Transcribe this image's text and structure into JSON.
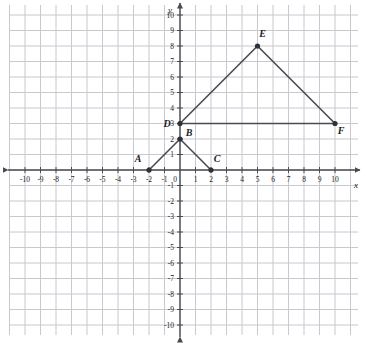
{
  "figure": {
    "type": "coordinate-plane",
    "x_axis_label": "x",
    "y_axis_label": "y",
    "x_ticks": [
      -10,
      -9,
      -8,
      -7,
      -6,
      -5,
      -4,
      -3,
      -2,
      -1,
      1,
      2,
      3,
      4,
      5,
      6,
      7,
      8,
      9,
      10
    ],
    "y_ticks": [
      10,
      9,
      8,
      7,
      6,
      5,
      4,
      3,
      2,
      1,
      -1,
      -2,
      -3,
      -4,
      -5,
      -6,
      -7,
      -8,
      -9,
      -10
    ],
    "origin_label": "0",
    "colors": {
      "grid": "#c8c8d0",
      "axis": "#4a4a52",
      "segment": "#4a4a52",
      "point": "#303038",
      "label": "#1a1a1a"
    }
  },
  "chart_data": {
    "type": "scatter",
    "title": "",
    "xlabel": "x",
    "ylabel": "y",
    "xlim": [
      -10,
      10
    ],
    "ylim": [
      -10,
      10
    ],
    "grid": true,
    "legend": "none",
    "points": [
      {
        "name": "A",
        "x": -2,
        "y": 0,
        "label": "A",
        "label_dx": -11,
        "label_dy": -8
      },
      {
        "name": "B",
        "x": 0,
        "y": 2,
        "label": "B",
        "label_dx": 9,
        "label_dy": -3
      },
      {
        "name": "C",
        "x": 2,
        "y": 0,
        "label": "C",
        "label_dx": 6,
        "label_dy": -8
      },
      {
        "name": "D",
        "x": 0,
        "y": 3,
        "label": "D",
        "label_dx": -13,
        "label_dy": 3
      },
      {
        "name": "E",
        "x": 5,
        "y": 8,
        "label": "E",
        "label_dx": 5,
        "label_dy": -9
      },
      {
        "name": "F",
        "x": 10,
        "y": 3,
        "label": "F",
        "label_dx": 6,
        "label_dy": 10
      }
    ],
    "segments": [
      {
        "name": "A-B",
        "from": "A",
        "to": "B"
      },
      {
        "name": "B-C",
        "from": "B",
        "to": "C"
      },
      {
        "name": "D-E",
        "from": "D",
        "to": "E"
      },
      {
        "name": "E-F",
        "from": "E",
        "to": "F"
      },
      {
        "name": "D-F",
        "from": "D",
        "to": "F"
      }
    ]
  },
  "geometry": {
    "origin_px_x": 180,
    "origin_px_y": 170,
    "unit_px": 15.5,
    "grid_left_px": 10,
    "grid_right_px": 358,
    "grid_top_px": 5,
    "grid_bottom_px": 335
  }
}
